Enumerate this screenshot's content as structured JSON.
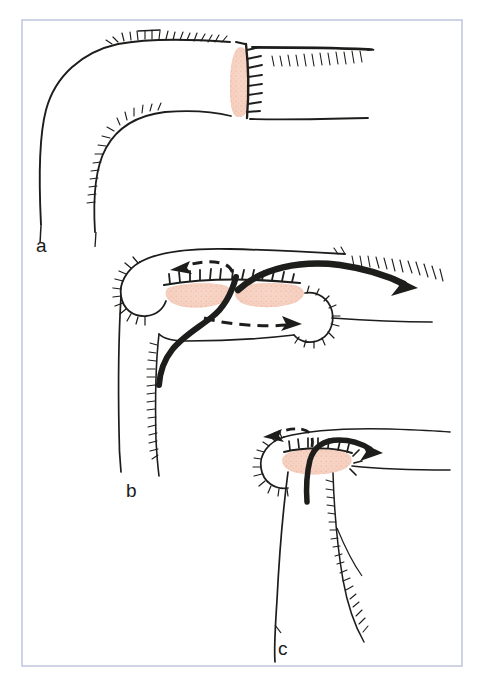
{
  "figure": {
    "kind": "surgical-technique-diagram",
    "background_color": "#ffffff",
    "frame": {
      "name": "figure-border",
      "color": "#b9c2db",
      "x": 22,
      "y": 20,
      "width": 440,
      "height": 646,
      "stroke_width": 1.4
    },
    "ink_color": "#1d1d1b",
    "mucosa_color": "#f7d3c4",
    "mucosa_stipple_color": "#eab5a1",
    "panels": [
      {
        "id": "a",
        "label": "a",
        "label_x": 36,
        "label_y": 252,
        "description": "End-to-side anastomosis completed; vertical suture line joining two bowel limbs, serosal hatching along the upper and lower walls."
      },
      {
        "id": "b",
        "label": "b",
        "label_x": 126,
        "label_y": 497,
        "description": "Transverse view of the stapled anastomosis with two mucosal ovals; solid arrows mark the antegrade flow and dashed arrows mark the retrograde limbs."
      },
      {
        "id": "c",
        "label": "c",
        "label_x": 278,
        "label_y": 655,
        "description": "Single mucosal oval with a short solid arrow to the right and a dashed arrow to the left, indicating bidirectional transit across the new stoma."
      }
    ],
    "annotations": {
      "solid_arrow_meaning": "antegrade flow",
      "dashed_arrow_meaning": "retrograde / reflux direction",
      "hatching_meaning": "cut serosal surface",
      "stitch_meaning": "interrupted suture line",
      "pink_oval_meaning": "exposed mucosa of the anastomosis"
    }
  }
}
